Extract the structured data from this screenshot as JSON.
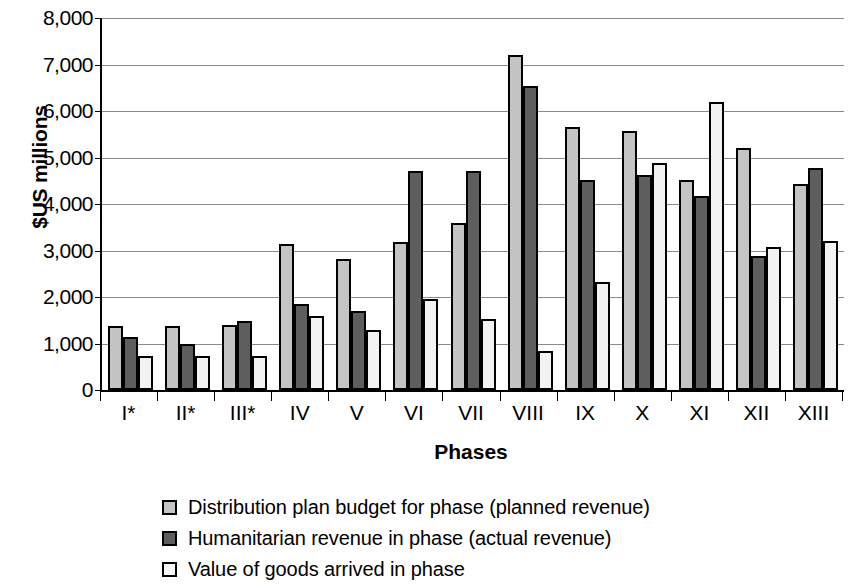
{
  "chart_data": {
    "type": "bar",
    "title": "",
    "xlabel": "Phases",
    "ylabel": "$US millions",
    "ylim": [
      0,
      8000
    ],
    "ytick_step": 1000,
    "ytick_labels": [
      "8,000",
      "7,000",
      "6,000",
      "5,000",
      "4,000",
      "3,000",
      "2,000",
      "1,000",
      "0"
    ],
    "ytick_values": [
      8000,
      7000,
      6000,
      5000,
      4000,
      3000,
      2000,
      1000,
      0
    ],
    "grid": true,
    "legend_position": "bottom",
    "categories": [
      "I*",
      "II*",
      "III*",
      "IV",
      "V",
      "VI",
      "VII",
      "VIII",
      "IX",
      "X",
      "XI",
      "XII",
      "XIII"
    ],
    "series": [
      {
        "name": "Distribution plan budget for phase (planned revenue)",
        "color": "#c4c4c4",
        "values": [
          1370,
          1380,
          1400,
          3150,
          2820,
          3180,
          3600,
          7200,
          5650,
          5580,
          4520,
          5200,
          4420
        ]
      },
      {
        "name": "Humanitarian revenue in phase (actual revenue)",
        "color": "#5e5e5e",
        "values": [
          1150,
          1000,
          1480,
          1850,
          1700,
          4700,
          4720,
          6540,
          4520,
          4620,
          4180,
          2880,
          4780
        ]
      },
      {
        "name": "Value of goods arrived in phase",
        "color": "#f2f2f2",
        "values": [
          730,
          740,
          740,
          1600,
          1280,
          1950,
          1520,
          840,
          2330,
          4880,
          6200,
          3080,
          3200
        ]
      }
    ]
  }
}
